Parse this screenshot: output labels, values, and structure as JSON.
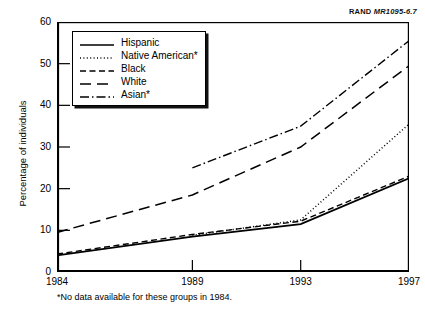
{
  "source_label": {
    "org": "RAND",
    "code": "MR1095-6.7"
  },
  "axes": {
    "ylabel": "Percentage of individuals",
    "yticks": [
      "0",
      "10",
      "20",
      "30",
      "40",
      "50",
      "60"
    ],
    "xticks": [
      "1984",
      "1989",
      "1993",
      "1997"
    ]
  },
  "footnote": "*No data available for these groups in 1984.",
  "legend": {
    "items": [
      {
        "label": "Hispanic",
        "style": "solid"
      },
      {
        "label": "Native American*",
        "style": "dotted"
      },
      {
        "label": "Black",
        "style": "dashed-short"
      },
      {
        "label": "White",
        "style": "dashed-long"
      },
      {
        "label": "Asian*",
        "style": "dash-dot"
      }
    ]
  },
  "chart_data": {
    "type": "line",
    "title": "",
    "xlabel": "",
    "ylabel": "Percentage of individuals",
    "x": [
      1984,
      1989,
      1993,
      1997
    ],
    "xlim": [
      1984,
      1997
    ],
    "ylim": [
      0,
      60
    ],
    "grid": false,
    "legend_position": "upper-left",
    "annotations": [
      "*No data available for these groups in 1984."
    ],
    "series": [
      {
        "name": "Hispanic",
        "style": "solid",
        "values": [
          4.0,
          8.5,
          11.5,
          22.5
        ]
      },
      {
        "name": "Native American*",
        "style": "dotted",
        "values": [
          null,
          8.8,
          12.5,
          35.5
        ]
      },
      {
        "name": "Black",
        "style": "dashed-short",
        "values": [
          4.3,
          9.0,
          12.2,
          23.0
        ]
      },
      {
        "name": "White",
        "style": "dashed-long",
        "values": [
          9.5,
          18.5,
          30.0,
          49.5
        ]
      },
      {
        "name": "Asian*",
        "style": "dash-dot",
        "values": [
          null,
          25.0,
          35.0,
          55.5
        ]
      }
    ]
  }
}
